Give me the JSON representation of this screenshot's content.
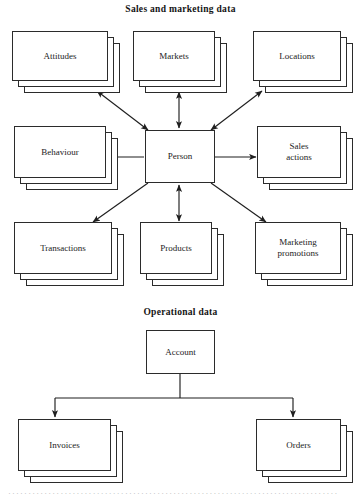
{
  "figure": {
    "sections": [
      {
        "id": "sales",
        "title": "Sales and marketing data"
      },
      {
        "id": "operational",
        "title": "Operational data"
      }
    ]
  },
  "nodes": {
    "attitudes": {
      "label": "Attitudes",
      "type": "stacked-card"
    },
    "markets": {
      "label": "Markets",
      "type": "stacked-card"
    },
    "locations": {
      "label": "Locations",
      "type": "stacked-card"
    },
    "behaviour": {
      "label": "Behaviour",
      "type": "stacked-card"
    },
    "person": {
      "label": "Person",
      "type": "single-box"
    },
    "sales_actions": {
      "label": "Sales\nactions",
      "line1": "Sales",
      "line2": "actions",
      "type": "stacked-card"
    },
    "transactions": {
      "label": "Transactions",
      "type": "stacked-card"
    },
    "products": {
      "label": "Products",
      "type": "stacked-card"
    },
    "marketing_promotions": {
      "label": "Marketing\npromotions",
      "line1": "Marketing",
      "line2": "promotions",
      "type": "stacked-card"
    },
    "account": {
      "label": "Account",
      "type": "single-box"
    },
    "invoices": {
      "label": "Invoices",
      "type": "stacked-card"
    },
    "orders": {
      "label": "Orders",
      "type": "stacked-card"
    }
  },
  "edges": [
    {
      "from": "person",
      "to": "attitudes",
      "arrow": "double"
    },
    {
      "from": "person",
      "to": "markets",
      "arrow": "double"
    },
    {
      "from": "person",
      "to": "locations",
      "arrow": "double"
    },
    {
      "from": "person",
      "to": "behaviour",
      "arrow": "single"
    },
    {
      "from": "person",
      "to": "sales_actions",
      "arrow": "single"
    },
    {
      "from": "person",
      "to": "transactions",
      "arrow": "single"
    },
    {
      "from": "person",
      "to": "products",
      "arrow": "double"
    },
    {
      "from": "person",
      "to": "marketing_promotions",
      "arrow": "single"
    },
    {
      "from": "account",
      "to": "invoices",
      "arrow": "single"
    },
    {
      "from": "account",
      "to": "orders",
      "arrow": "single"
    }
  ],
  "style": {
    "stroke": "#2b2b2b",
    "fill": "#ffffff",
    "text": "#1b1b1b",
    "background": "#ffffff"
  },
  "footer": {
    "text": "··················································································"
  }
}
